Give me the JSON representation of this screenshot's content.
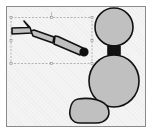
{
  "canvas": {
    "background": "#f4f4f4",
    "border_color": "#8a8a8a"
  },
  "colors": {
    "shape_fill": "#c0c0c0",
    "shape_stroke": "#111111",
    "selection_stroke": "#9a9a9a"
  },
  "selection": {
    "x": 11,
    "y": 17,
    "width": 81,
    "height": 46,
    "handles": [
      "top-left",
      "top-center",
      "top-right",
      "middle-left",
      "middle-right",
      "bottom-left",
      "bottom-center",
      "bottom-right"
    ]
  },
  "shapes": [
    {
      "name": "hand-shape",
      "type": "polygon"
    },
    {
      "name": "forearm-shape",
      "type": "polygon"
    },
    {
      "name": "upper-arm-shape",
      "type": "polygon"
    },
    {
      "name": "shoulder-dot",
      "type": "circle"
    },
    {
      "name": "head-shape",
      "type": "circle"
    },
    {
      "name": "neck-shape",
      "type": "rect"
    },
    {
      "name": "body-shape",
      "type": "ellipse"
    },
    {
      "name": "foot-shape",
      "type": "blob"
    }
  ]
}
